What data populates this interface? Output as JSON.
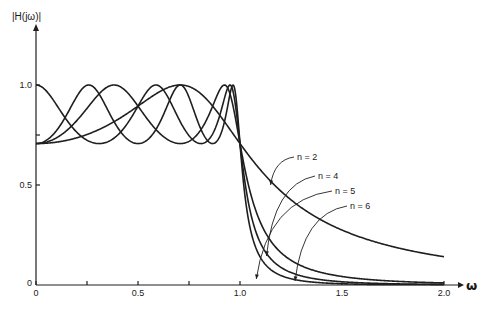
{
  "chart_data": {
    "type": "line",
    "title": "",
    "ylabel": "|H(jω)|",
    "xlabel": "ω",
    "xlim": [
      0,
      2.0
    ],
    "ylim": [
      0,
      1.0
    ],
    "grid": false,
    "legend": "inline labels with leader arrows",
    "x_ticks": [
      {
        "value": 0,
        "label": "0"
      },
      {
        "value": 0.25,
        "label": ""
      },
      {
        "value": 0.5,
        "label": "0.5"
      },
      {
        "value": 0.75,
        "label": ""
      },
      {
        "value": 1.0,
        "label": "1.0"
      },
      {
        "value": 1.5,
        "label": "1.5"
      },
      {
        "value": 2.0,
        "label": "2.0"
      }
    ],
    "y_ticks": [
      {
        "value": 0,
        "label": "0"
      },
      {
        "value": 0.5,
        "label": "0.5"
      },
      {
        "value": 0.75,
        "label": ""
      },
      {
        "value": 1.0,
        "label": "1.0"
      }
    ],
    "ripple_epsilon": 1.0,
    "x": [
      0,
      0.25,
      0.5,
      0.75,
      1.0,
      1.25,
      1.5,
      1.75,
      2.0
    ],
    "series": [
      {
        "name": "n = 2",
        "order": 2,
        "values": [
          0.707,
          0.753,
          0.894,
          0.992,
          0.707,
          0.426,
          0.275,
          0.191,
          0.141
        ],
        "label_pos": [
          297,
          160
        ],
        "arrow_to": [
          1.15,
          0.5
        ]
      },
      {
        "name": "n = 4",
        "order": 4,
        "values": [
          0.707,
          0.883,
          0.894,
          0.718,
          0.707,
          0.141,
          0.043,
          0.019,
          0.01
        ],
        "label_pos": [
          318,
          179
        ],
        "arrow_to": [
          1.13,
          0.145
        ]
      },
      {
        "name": "n = 5",
        "order": 5,
        "values": [
          1.0,
          0.728,
          0.894,
          0.709,
          0.707,
          0.066,
          0.016,
          0.006,
          0.003
        ],
        "label_pos": [
          335,
          194
        ],
        "arrow_to": [
          1.08,
          0.03
        ]
      },
      {
        "name": "n = 6",
        "order": 6,
        "values": [
          0.707,
          0.998,
          0.894,
          0.74,
          0.707,
          0.031,
          0.006,
          0.002,
          0.001
        ],
        "label_pos": [
          350,
          209
        ],
        "arrow_to": [
          1.27,
          0.02
        ]
      }
    ]
  },
  "axes": {
    "y_title": "|H(jω)|",
    "x_title": "ω"
  }
}
